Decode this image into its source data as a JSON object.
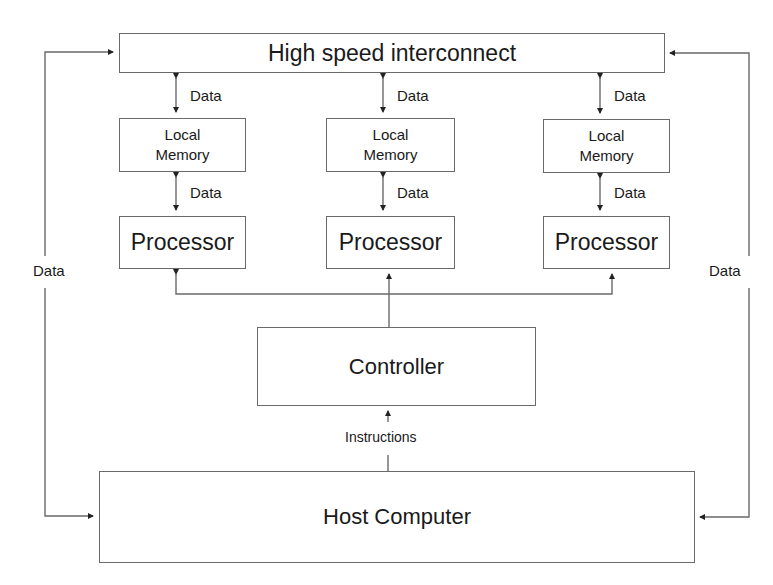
{
  "diagram": {
    "type": "block-diagram",
    "title": "",
    "interconnect": {
      "label": "High speed interconnect"
    },
    "nodes": [
      {
        "id": "node-left",
        "memory_label_1": "Local",
        "memory_label_2": "Memory",
        "processor_label": "Processor",
        "link_top_label": "Data",
        "link_mid_label": "Data"
      },
      {
        "id": "node-middle",
        "memory_label_1": "Local",
        "memory_label_2": "Memory",
        "processor_label": "Processor",
        "link_top_label": "Data",
        "link_mid_label": "Data"
      },
      {
        "id": "node-right",
        "memory_label_1": "Local",
        "memory_label_2": "Memory",
        "processor_label": "Processor",
        "link_top_label": "Data",
        "link_mid_label": "Data"
      }
    ],
    "controller": {
      "label": "Controller"
    },
    "host": {
      "label": "Host Computer"
    },
    "edges": {
      "host_to_controller_label": "Instructions",
      "left_loop_label": "Data",
      "right_loop_label": "Data"
    },
    "colors": {
      "line": "#6a6a6a",
      "arrowhead": "#222222",
      "text": "#1a1a1a",
      "background": "#ffffff"
    }
  }
}
